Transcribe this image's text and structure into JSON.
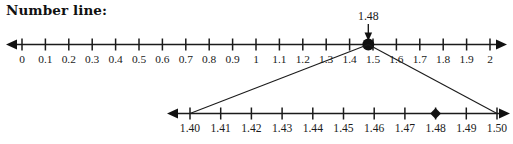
{
  "page": {
    "title": "Number line:",
    "background_color": "#ffffff",
    "ink_color": "#1b1b1b",
    "width": 513,
    "height": 144
  },
  "callout": {
    "value_label": "1.48",
    "pointer_icon": "down-arrow-icon",
    "target_value": 1.48
  },
  "chart_data": {
    "type": "number-line",
    "title": "Number line:",
    "lines": [
      {
        "name": "main-number-line",
        "xlim": [
          0,
          2
        ],
        "tick_step": 0.1,
        "tick_labels": [
          "0",
          "0.1",
          "0.2",
          "0.3",
          "0.4",
          "0.5",
          "0.6",
          "0.7",
          "0.8",
          "0.9",
          "1",
          "1.1",
          "1.2",
          "1.3",
          "1.4",
          "1.5",
          "1.6",
          "1.7",
          "1.8",
          "1.9",
          "2"
        ],
        "tick_values": [
          0,
          0.1,
          0.2,
          0.3,
          0.4,
          0.5,
          0.6,
          0.7,
          0.8,
          0.9,
          1,
          1.1,
          1.2,
          1.3,
          1.4,
          1.5,
          1.6,
          1.7,
          1.8,
          1.9,
          2
        ],
        "arrows": [
          "left",
          "right"
        ],
        "markers": [
          {
            "value": 1.48,
            "shape": "circle",
            "label": "1.48"
          }
        ]
      },
      {
        "name": "zoomed-number-line",
        "xlim": [
          1.4,
          1.5
        ],
        "tick_step": 0.01,
        "tick_labels": [
          "1.40",
          "1.41",
          "1.42",
          "1.43",
          "1.44",
          "1.45",
          "1.46",
          "1.47",
          "1.48",
          "1.49",
          "1.50"
        ],
        "tick_values": [
          1.4,
          1.41,
          1.42,
          1.43,
          1.44,
          1.45,
          1.46,
          1.47,
          1.48,
          1.49,
          1.5
        ],
        "arrows": [
          "left",
          "right"
        ],
        "markers": [
          {
            "value": 1.48,
            "shape": "diamond",
            "label": ""
          }
        ]
      }
    ],
    "zoom_connectors": {
      "from_value": 1.48,
      "to_range": [
        1.4,
        1.5
      ],
      "description": "magnification lines from the main line to the zoomed line"
    },
    "xlabel": "",
    "ylabel": "",
    "grid": false,
    "legend": null
  }
}
